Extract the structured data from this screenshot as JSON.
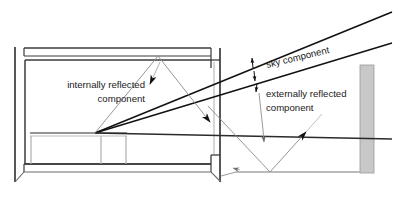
{
  "diagram": {
    "type": "architectural-section-diagram",
    "colors": {
      "line": "#1a1a1a",
      "thin_line": "#4d4d4d",
      "leader_line": "#8c8c8c",
      "opposing_building_fill": "#c8c8c8",
      "opposing_building_stroke": "#9a9a9a",
      "background": "#ffffff",
      "text": "#1a1a1a"
    },
    "labels": {
      "internally_reflected": {
        "line1": "internally reflected",
        "line2": "component",
        "align": "right",
        "x": 145,
        "y1": 88,
        "y2": 102
      },
      "sky": {
        "text": "sky component",
        "rotation_deg": -13.5,
        "x": 267,
        "y": 68
      },
      "externally_reflected": {
        "line1": "externally reflected",
        "line2": "component",
        "align": "left",
        "x": 266,
        "y1": 97,
        "y2": 111
      }
    },
    "elements": {
      "room": "interior room section with ceiling slab, floor slab, left wall and right window wall",
      "desk": "work plane / desk with two supports inside the room",
      "window": "window aperture in right wall with reveal",
      "opposing_building": "shaded vertical block at far right representing obstruction",
      "ground": "external ground line outside the window",
      "sky_ray": "ray from sky entering window directly to work plane",
      "externally_reflected_ray": "ray reflected off external ground/obstruction into window",
      "internally_reflected_ray": "ray reflected from room ceiling and surfaces to work plane"
    }
  }
}
